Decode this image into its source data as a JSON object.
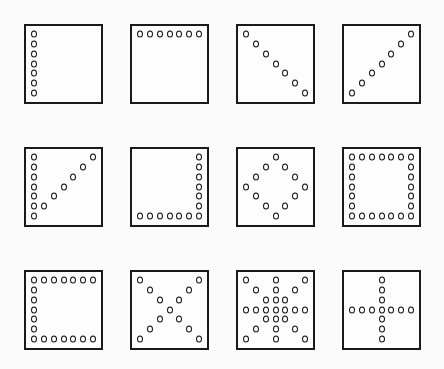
{
  "diagram": {
    "grid_size": 7,
    "layout": {
      "columns": [
        24,
        130,
        236,
        342
      ],
      "rows": [
        24,
        147,
        270
      ]
    },
    "panels": [
      {
        "name": "left-column",
        "row": 0,
        "col": 0,
        "points": [
          [
            0,
            0
          ],
          [
            0,
            1
          ],
          [
            0,
            2
          ],
          [
            0,
            3
          ],
          [
            0,
            4
          ],
          [
            0,
            5
          ],
          [
            0,
            6
          ]
        ]
      },
      {
        "name": "top-row",
        "row": 0,
        "col": 1,
        "points": [
          [
            0,
            0
          ],
          [
            1,
            0
          ],
          [
            2,
            0
          ],
          [
            3,
            0
          ],
          [
            4,
            0
          ],
          [
            5,
            0
          ],
          [
            6,
            0
          ]
        ]
      },
      {
        "name": "main-diagonal",
        "row": 0,
        "col": 2,
        "points": [
          [
            0,
            0
          ],
          [
            1,
            1
          ],
          [
            2,
            2
          ],
          [
            3,
            3
          ],
          [
            4,
            4
          ],
          [
            5,
            5
          ],
          [
            6,
            6
          ]
        ]
      },
      {
        "name": "anti-diagonal",
        "row": 0,
        "col": 3,
        "points": [
          [
            6,
            0
          ],
          [
            5,
            1
          ],
          [
            4,
            2
          ],
          [
            3,
            3
          ],
          [
            2,
            4
          ],
          [
            1,
            5
          ],
          [
            0,
            6
          ]
        ]
      },
      {
        "name": "left-column-and-anti-diagonal",
        "row": 1,
        "col": 0,
        "points": [
          [
            0,
            0
          ],
          [
            0,
            1
          ],
          [
            0,
            2
          ],
          [
            0,
            3
          ],
          [
            0,
            4
          ],
          [
            0,
            5
          ],
          [
            0,
            6
          ],
          [
            1,
            5
          ],
          [
            2,
            4
          ],
          [
            3,
            3
          ],
          [
            4,
            2
          ],
          [
            5,
            1
          ],
          [
            6,
            0
          ]
        ]
      },
      {
        "name": "right-column-and-bottom-row",
        "row": 1,
        "col": 1,
        "points": [
          [
            6,
            0
          ],
          [
            6,
            1
          ],
          [
            6,
            2
          ],
          [
            6,
            3
          ],
          [
            6,
            4
          ],
          [
            6,
            5
          ],
          [
            6,
            6
          ],
          [
            0,
            6
          ],
          [
            1,
            6
          ],
          [
            2,
            6
          ],
          [
            3,
            6
          ],
          [
            4,
            6
          ],
          [
            5,
            6
          ]
        ]
      },
      {
        "name": "diamond",
        "row": 1,
        "col": 2,
        "points": [
          [
            3,
            0
          ],
          [
            2,
            1
          ],
          [
            4,
            1
          ],
          [
            1,
            2
          ],
          [
            5,
            2
          ],
          [
            0,
            3
          ],
          [
            6,
            3
          ],
          [
            1,
            4
          ],
          [
            5,
            4
          ],
          [
            2,
            5
          ],
          [
            4,
            5
          ],
          [
            3,
            6
          ]
        ]
      },
      {
        "name": "square-outline",
        "row": 1,
        "col": 3,
        "points": [
          [
            0,
            0
          ],
          [
            1,
            0
          ],
          [
            2,
            0
          ],
          [
            3,
            0
          ],
          [
            4,
            0
          ],
          [
            5,
            0
          ],
          [
            6,
            0
          ],
          [
            0,
            1
          ],
          [
            6,
            1
          ],
          [
            0,
            2
          ],
          [
            6,
            2
          ],
          [
            0,
            3
          ],
          [
            6,
            3
          ],
          [
            0,
            4
          ],
          [
            6,
            4
          ],
          [
            0,
            5
          ],
          [
            6,
            5
          ],
          [
            0,
            6
          ],
          [
            1,
            6
          ],
          [
            2,
            6
          ],
          [
            3,
            6
          ],
          [
            4,
            6
          ],
          [
            5,
            6
          ],
          [
            6,
            6
          ]
        ]
      },
      {
        "name": "c-shape",
        "row": 2,
        "col": 0,
        "points": [
          [
            0,
            0
          ],
          [
            1,
            0
          ],
          [
            2,
            0
          ],
          [
            3,
            0
          ],
          [
            4,
            0
          ],
          [
            5,
            0
          ],
          [
            6,
            0
          ],
          [
            0,
            1
          ],
          [
            0,
            2
          ],
          [
            0,
            3
          ],
          [
            0,
            4
          ],
          [
            0,
            5
          ],
          [
            0,
            6
          ],
          [
            1,
            6
          ],
          [
            2,
            6
          ],
          [
            3,
            6
          ],
          [
            4,
            6
          ],
          [
            5,
            6
          ],
          [
            6,
            6
          ]
        ]
      },
      {
        "name": "x-cross",
        "row": 2,
        "col": 1,
        "points": [
          [
            0,
            0
          ],
          [
            1,
            1
          ],
          [
            2,
            2
          ],
          [
            3,
            3
          ],
          [
            4,
            4
          ],
          [
            5,
            5
          ],
          [
            6,
            6
          ],
          [
            6,
            0
          ],
          [
            5,
            1
          ],
          [
            4,
            2
          ],
          [
            2,
            4
          ],
          [
            1,
            5
          ],
          [
            0,
            6
          ]
        ]
      },
      {
        "name": "star",
        "row": 2,
        "col": 2,
        "points": [
          [
            0,
            0
          ],
          [
            3,
            0
          ],
          [
            6,
            0
          ],
          [
            1,
            1
          ],
          [
            3,
            1
          ],
          [
            5,
            1
          ],
          [
            2,
            2
          ],
          [
            3,
            2
          ],
          [
            4,
            2
          ],
          [
            0,
            3
          ],
          [
            1,
            3
          ],
          [
            2,
            3
          ],
          [
            3,
            3
          ],
          [
            4,
            3
          ],
          [
            5,
            3
          ],
          [
            6,
            3
          ],
          [
            2,
            4
          ],
          [
            3,
            4
          ],
          [
            4,
            4
          ],
          [
            1,
            5
          ],
          [
            3,
            5
          ],
          [
            5,
            5
          ],
          [
            0,
            6
          ],
          [
            3,
            6
          ],
          [
            6,
            6
          ]
        ]
      },
      {
        "name": "plus-cross",
        "row": 2,
        "col": 3,
        "points": [
          [
            3,
            0
          ],
          [
            3,
            1
          ],
          [
            3,
            2
          ],
          [
            0,
            3
          ],
          [
            1,
            3
          ],
          [
            2,
            3
          ],
          [
            3,
            3
          ],
          [
            4,
            3
          ],
          [
            5,
            3
          ],
          [
            6,
            3
          ],
          [
            3,
            4
          ],
          [
            3,
            5
          ],
          [
            3,
            6
          ]
        ]
      }
    ]
  }
}
